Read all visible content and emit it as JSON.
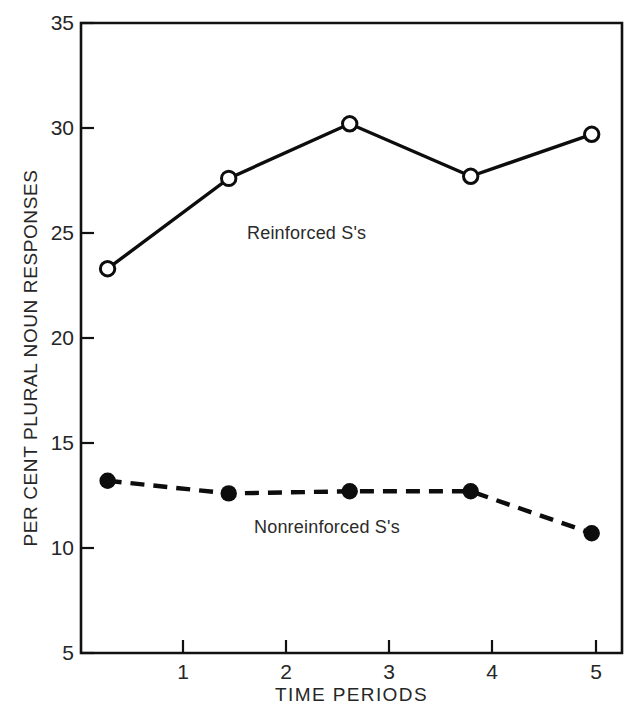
{
  "chart_data": {
    "type": "line",
    "title": "",
    "xlabel": "TIME PERIODS",
    "ylabel": "PER CENT PLURAL NOUN RESPONSES",
    "x": [
      1,
      2,
      3,
      4,
      5
    ],
    "categories": [
      "1",
      "2",
      "3",
      "4",
      "5"
    ],
    "xlim": [
      0.78,
      5.25
    ],
    "ylim": [
      5,
      35
    ],
    "xticks": [
      "1",
      "2",
      "3",
      "4",
      "5"
    ],
    "yticks": [
      "5",
      "10",
      "15",
      "20",
      "25",
      "30",
      "35"
    ],
    "grid": false,
    "legend_position": "inline-annotation",
    "series": [
      {
        "name": "Reinforced S's",
        "values": [
          23.3,
          27.6,
          30.2,
          27.7,
          29.7
        ],
        "marker": "open-circle",
        "linestyle": "solid",
        "color": "#000000"
      },
      {
        "name": "Nonreinforced S's",
        "values": [
          13.2,
          12.6,
          12.7,
          12.7,
          10.7
        ],
        "marker": "filled-circle",
        "linestyle": "dashed",
        "color": "#000000"
      }
    ],
    "annotations": [
      {
        "text": "Reinforced S's",
        "x": 2.6,
        "y": 24.7
      },
      {
        "text": "Nonreinforced S's",
        "x": 2.68,
        "y": 11.0
      }
    ]
  },
  "axes": {
    "y_title": "PER CENT PLURAL NOUN RESPONSES",
    "x_title": "TIME PERIODS",
    "y_tick_labels": [
      "35",
      "30",
      "25",
      "20",
      "15",
      "10",
      "5"
    ],
    "x_tick_labels": [
      "1",
      "2",
      "3",
      "4",
      "5"
    ]
  },
  "colors": {
    "ink": "#000000",
    "text": "#262626",
    "background": "#ffffff"
  }
}
